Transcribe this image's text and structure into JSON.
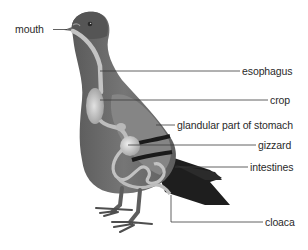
{
  "diagram": {
    "colors": {
      "background": "#ffffff",
      "body_dark": "#4a4a4a",
      "body_mid": "#6b6b6b",
      "body_light": "#8a8a8a",
      "tail_black": "#1e1e1e",
      "organ_light": "#c8c8c8",
      "organ_highlight": "#e6e6e6",
      "leader_line": "#3a3a3a",
      "text": "#2a2a2a"
    },
    "labels": [
      {
        "id": "mouth",
        "text": "mouth",
        "side": "left"
      },
      {
        "id": "esophagus",
        "text": "esophagus",
        "side": "right"
      },
      {
        "id": "crop",
        "text": "crop",
        "side": "right"
      },
      {
        "id": "glandular-stomach",
        "text": "glandular part of stomach",
        "side": "right"
      },
      {
        "id": "gizzard",
        "text": "gizzard",
        "side": "right"
      },
      {
        "id": "intestines",
        "text": "intestines",
        "side": "right"
      },
      {
        "id": "cloaca",
        "text": "cloaca",
        "side": "right"
      }
    ]
  }
}
